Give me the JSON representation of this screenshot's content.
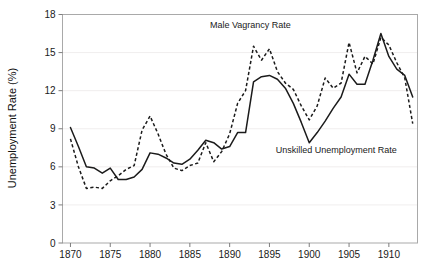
{
  "chart_data": {
    "type": "line",
    "title": "",
    "xlabel": "",
    "ylabel": "Unemployment Rate (%)",
    "xlim": [
      1869,
      1913.6
    ],
    "ylim": [
      0,
      18
    ],
    "grid": true,
    "legend_position": "inline-annotations",
    "y_ticks": [
      0,
      3,
      6,
      9,
      12,
      15,
      18
    ],
    "y_tick_labels": [
      "0",
      "3",
      "6",
      "9",
      "12",
      "15",
      "18"
    ],
    "x_ticks": [
      1870,
      1875,
      1880,
      1885,
      1890,
      1895,
      1900,
      1905,
      1910
    ],
    "x_tick_labels": [
      "1870",
      "1875",
      "1880",
      "1885",
      "1890",
      "1895",
      "1900",
      "1905",
      "1910"
    ],
    "x": [
      1870,
      1871,
      1872,
      1873,
      1874,
      1875,
      1876,
      1877,
      1878,
      1879,
      1880,
      1881,
      1882,
      1883,
      1884,
      1885,
      1886,
      1887,
      1888,
      1889,
      1890,
      1891,
      1892,
      1893,
      1894,
      1895,
      1896,
      1897,
      1898,
      1899,
      1900,
      1901,
      1902,
      1903,
      1904,
      1905,
      1906,
      1907,
      1908,
      1909,
      1910,
      1911,
      1912,
      1913
    ],
    "series": [
      {
        "name": "Unskilled Unemployment Rate",
        "style": "solid",
        "color": "#1b1b1b",
        "values": [
          9.1,
          7.6,
          6.0,
          5.9,
          5.5,
          5.9,
          5.0,
          5.0,
          5.2,
          5.8,
          7.1,
          7.0,
          6.7,
          6.3,
          6.2,
          6.6,
          7.3,
          8.1,
          7.9,
          7.4,
          7.6,
          8.7,
          8.7,
          12.7,
          13.1,
          13.2,
          12.9,
          12.2,
          11.0,
          9.5,
          7.9,
          8.7,
          9.6,
          10.6,
          11.5,
          13.3,
          12.5,
          12.5,
          14.4,
          16.5,
          14.7,
          13.7,
          13.2,
          11.5
        ]
      },
      {
        "name": "Male Vagrancy Rate",
        "style": "dashed",
        "color": "#1b1b1b",
        "values": [
          8.2,
          6.0,
          4.3,
          4.4,
          4.3,
          4.9,
          5.3,
          5.8,
          6.1,
          8.9,
          10.0,
          8.6,
          7.0,
          5.9,
          5.7,
          6.1,
          6.3,
          7.9,
          6.4,
          7.2,
          8.6,
          11.0,
          12.0,
          15.5,
          14.4,
          15.3,
          13.5,
          12.6,
          12.1,
          10.8,
          9.7,
          10.8,
          13.0,
          12.2,
          12.6,
          15.8,
          13.4,
          14.7,
          14.1,
          16.2,
          15.6,
          14.2,
          13.0,
          9.4
        ]
      }
    ],
    "annotations": [
      {
        "text": "Male Vagrancy Rate",
        "x_year": 1892.6,
        "y_value": 16.9,
        "target_series": "Male Vagrancy Rate"
      },
      {
        "text": "Unskilled Unemployment Rate",
        "x_year": 1903.4,
        "y_value": 7.1,
        "target_series": "Unskilled Unemployment Rate"
      }
    ]
  }
}
